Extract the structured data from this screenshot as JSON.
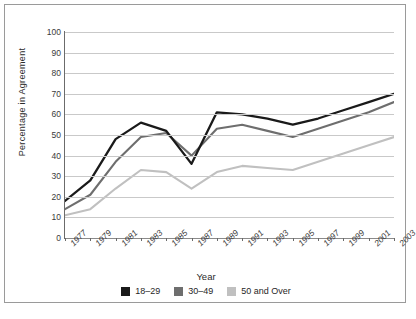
{
  "chart_data": {
    "type": "line",
    "title": "",
    "xlabel": "Year",
    "ylabel": "Percentage in Agreement",
    "ylim": [
      0,
      100
    ],
    "ytick_step": 10,
    "grid": true,
    "legend_position": "bottom",
    "categories": [
      "1977",
      "1979",
      "1981",
      "1983",
      "1985",
      "1987",
      "1989",
      "1991",
      "1993",
      "1995",
      "1997",
      "1999",
      "2001",
      "2003"
    ],
    "yticks": [
      "0",
      "10",
      "20",
      "30",
      "40",
      "50",
      "60",
      "70",
      "80",
      "90",
      "100"
    ],
    "series": [
      {
        "name": "18-29",
        "color": "#1a1a1a",
        "values": [
          18,
          28,
          48,
          56,
          52,
          36,
          61,
          60,
          58,
          55,
          58,
          62,
          66,
          70
        ]
      },
      {
        "name": "30-49",
        "color": "#6e6e6e",
        "values": [
          14,
          21,
          37,
          49,
          51,
          40,
          53,
          55,
          52,
          49,
          53,
          57,
          61,
          66
        ]
      },
      {
        "name": "50 and Over",
        "color": "#c0c0c0",
        "values": [
          11,
          14,
          24,
          33,
          32,
          24,
          32,
          35,
          34,
          33,
          37,
          41,
          45,
          49
        ]
      }
    ]
  },
  "legend": {
    "items": [
      {
        "label": "18–29",
        "color": "#1a1a1a"
      },
      {
        "label": "30–49",
        "color": "#6e6e6e"
      },
      {
        "label": "50 and Over",
        "color": "#c0c0c0"
      }
    ]
  },
  "caption": {
    "text": ""
  }
}
